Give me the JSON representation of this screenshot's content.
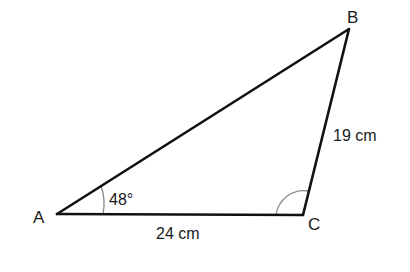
{
  "diagram": {
    "type": "triangle",
    "vertices": [
      {
        "label": "A",
        "x": 57,
        "y": 214
      },
      {
        "label": "B",
        "x": 349,
        "y": 29
      },
      {
        "label": "C",
        "x": 303,
        "y": 215
      }
    ],
    "sides": [
      {
        "name": "AC",
        "label": "24 cm"
      },
      {
        "name": "BC",
        "label": "19 cm"
      },
      {
        "name": "AB",
        "label": ""
      }
    ],
    "angles": [
      {
        "vertex": "A",
        "label": "48°",
        "marked": true
      },
      {
        "vertex": "C",
        "label": "",
        "marked": true
      }
    ],
    "colors": {
      "line": "#111111",
      "arc": "#888888",
      "background": "#ffffff"
    }
  }
}
